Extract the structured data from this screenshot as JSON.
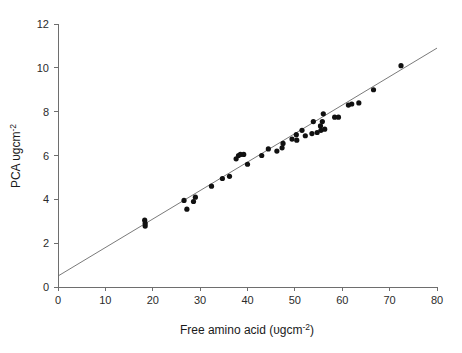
{
  "chart_data": {
    "type": "scatter",
    "title": "",
    "xlabel": "Free amino acid (υgcm⁻²)",
    "xlabel_parts": {
      "base": "Free amino acid (υgcm",
      "sup": "-2",
      "tail": ")"
    },
    "ylabel": "PCA υgcm⁻²",
    "ylabel_parts": {
      "base": "PCA υgcm",
      "sup": "-2"
    },
    "xlim": [
      0,
      80
    ],
    "ylim": [
      0,
      12
    ],
    "xticks": [
      0,
      10,
      20,
      30,
      40,
      50,
      60,
      70,
      80
    ],
    "xtick_labels": [
      "0",
      "10",
      "20",
      "30",
      "40",
      "50",
      "60",
      "70",
      "80"
    ],
    "yticks": [
      0,
      2,
      4,
      6,
      8,
      10,
      12
    ],
    "ytick_labels": [
      "0",
      "2",
      "4",
      "6",
      "8",
      "10",
      "12"
    ],
    "grid": false,
    "legend": null,
    "marker": {
      "shape": "circle",
      "color": "#111111",
      "size_px": 5.2
    },
    "trendline": {
      "type": "linear",
      "color": "#6b6b6b",
      "x_start": 0,
      "y_start": 0.5,
      "x_end": 80,
      "y_end": 10.9,
      "slope": 0.13,
      "intercept": 0.5
    },
    "points": [
      {
        "x": 18.3,
        "y": 3.05
      },
      {
        "x": 18.4,
        "y": 2.78
      },
      {
        "x": 18.4,
        "y": 2.9
      },
      {
        "x": 26.6,
        "y": 3.95
      },
      {
        "x": 27.2,
        "y": 3.55
      },
      {
        "x": 28.6,
        "y": 3.9
      },
      {
        "x": 29.0,
        "y": 4.1
      },
      {
        "x": 32.4,
        "y": 4.6
      },
      {
        "x": 34.7,
        "y": 4.95
      },
      {
        "x": 36.2,
        "y": 5.05
      },
      {
        "x": 37.6,
        "y": 5.85
      },
      {
        "x": 38.1,
        "y": 6.0
      },
      {
        "x": 38.5,
        "y": 6.05
      },
      {
        "x": 39.2,
        "y": 6.05
      },
      {
        "x": 40.0,
        "y": 5.6
      },
      {
        "x": 43.0,
        "y": 6.0
      },
      {
        "x": 44.4,
        "y": 6.3
      },
      {
        "x": 46.2,
        "y": 6.2
      },
      {
        "x": 47.3,
        "y": 6.35
      },
      {
        "x": 47.5,
        "y": 6.55
      },
      {
        "x": 49.4,
        "y": 6.75
      },
      {
        "x": 50.3,
        "y": 6.95
      },
      {
        "x": 50.4,
        "y": 6.7
      },
      {
        "x": 51.5,
        "y": 7.15
      },
      {
        "x": 52.2,
        "y": 6.9
      },
      {
        "x": 53.6,
        "y": 7.0
      },
      {
        "x": 53.9,
        "y": 7.55
      },
      {
        "x": 54.7,
        "y": 7.05
      },
      {
        "x": 55.4,
        "y": 7.35
      },
      {
        "x": 55.5,
        "y": 7.15
      },
      {
        "x": 55.8,
        "y": 7.55
      },
      {
        "x": 56.0,
        "y": 7.9
      },
      {
        "x": 56.3,
        "y": 7.2
      },
      {
        "x": 58.4,
        "y": 7.75
      },
      {
        "x": 59.2,
        "y": 7.75
      },
      {
        "x": 61.3,
        "y": 8.3
      },
      {
        "x": 62.0,
        "y": 8.35
      },
      {
        "x": 63.5,
        "y": 8.4
      },
      {
        "x": 66.6,
        "y": 9.0
      },
      {
        "x": 72.4,
        "y": 10.1
      }
    ]
  }
}
